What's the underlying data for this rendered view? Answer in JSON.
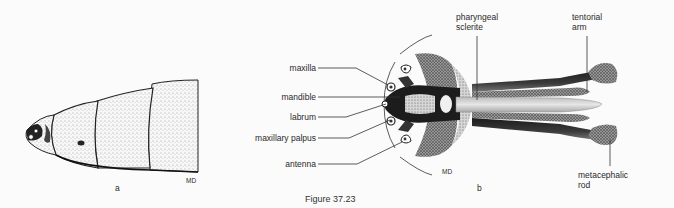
{
  "figure": {
    "caption": "Figure 37.23",
    "panel_a": {
      "letter": "a",
      "signature": "MD"
    },
    "panel_b": {
      "letter": "b",
      "signature": "MD",
      "labels_left": [
        "maxilla",
        "mandible",
        "labrum",
        "maxillary palpus",
        "antenna"
      ],
      "labels_top": [
        {
          "line1": "pharyngeal",
          "line2": "sclerite"
        },
        {
          "line1": "tentorial",
          "line2": "arm"
        }
      ],
      "labels_bottom": [
        {
          "line1": "metacephalic",
          "line2": "rod"
        }
      ]
    }
  }
}
